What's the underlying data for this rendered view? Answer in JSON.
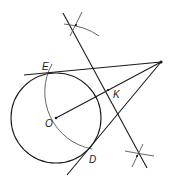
{
  "diagram": {
    "type": "geometric-construction",
    "stroke_color": "#1a1a1a",
    "arc_color": "#555555",
    "labels": {
      "E": "E",
      "K": "K",
      "O": "O",
      "D": "D"
    },
    "points": {
      "O": [
        56,
        118
      ],
      "P": [
        161,
        62
      ],
      "K": [
        108,
        90
      ],
      "E": [
        54,
        73
      ],
      "D": [
        90,
        148
      ]
    },
    "circle": {
      "center": "O",
      "radius": 45
    }
  }
}
